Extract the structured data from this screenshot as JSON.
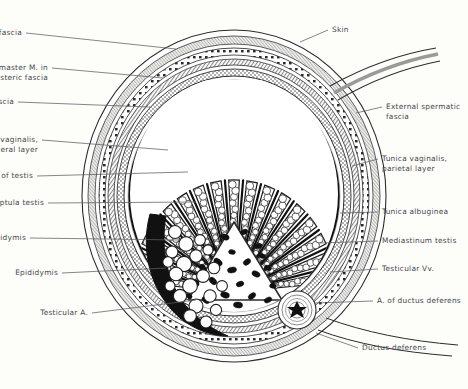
{
  "figure": {
    "type": "anatomical-illustration",
    "background_color": "#fdfdf9",
    "ink_color": "#2b2b2b",
    "label_color": "#44484f"
  },
  "labels_left": [
    {
      "id": "dartos",
      "text": "Dartos M. in superficial fascia",
      "x": 22,
      "y": 33,
      "lead_to_x": 176,
      "lead_to_y": 49
    },
    {
      "id": "cremaster",
      "text": "Cremaster M. in\ncremasteric fascia",
      "x": 48,
      "y": 68,
      "lead_to_x": 163,
      "lead_to_y": 78
    },
    {
      "id": "internal-spermatic",
      "text": "Internal spermatic fascia",
      "x": 14,
      "y": 102,
      "lead_to_x": 150,
      "lead_to_y": 107
    },
    {
      "id": "tunica-visceral",
      "text": "Tunica vaginalis,\nvisceral layer",
      "x": 38,
      "y": 140,
      "lead_to_x": 168,
      "lead_to_y": 150
    },
    {
      "id": "lobules",
      "text": "Lobules of testis",
      "x": 33,
      "y": 176,
      "lead_to_x": 188,
      "lead_to_y": 172
    },
    {
      "id": "septula",
      "text": "Septula testis",
      "x": 44,
      "y": 203,
      "lead_to_x": 196,
      "lead_to_y": 202
    },
    {
      "id": "sinus-epididymis",
      "text": "Sinus of epididymis",
      "x": 26,
      "y": 238,
      "lead_to_x": 181,
      "lead_to_y": 240
    },
    {
      "id": "epididymis",
      "text": "Epididymis",
      "x": 58,
      "y": 273,
      "lead_to_x": 166,
      "lead_to_y": 268
    },
    {
      "id": "testicular-a",
      "text": "Testicular A.",
      "x": 88,
      "y": 313,
      "lead_to_x": 196,
      "lead_to_y": 300
    }
  ],
  "labels_right": [
    {
      "id": "skin",
      "text": "Skin",
      "x": 332,
      "y": 30,
      "lead_to_x": 300,
      "lead_to_y": 42
    },
    {
      "id": "external-spermatic",
      "text": "External spermatic\nfascia",
      "x": 386,
      "y": 107,
      "lead_to_x": 356,
      "lead_to_y": 113
    },
    {
      "id": "tunica-parietal",
      "text": "Tunica vaginalis,\nparietal layer",
      "x": 382,
      "y": 159,
      "lead_to_x": 352,
      "lead_to_y": 166
    },
    {
      "id": "tunica-albuginea",
      "text": "Tunica albuginea",
      "x": 382,
      "y": 212,
      "lead_to_x": 340,
      "lead_to_y": 213
    },
    {
      "id": "mediastinum",
      "text": "Mediastinum testis",
      "x": 382,
      "y": 241,
      "lead_to_x": 320,
      "lead_to_y": 243
    },
    {
      "id": "testicular-vv",
      "text": "Testicular Vv.",
      "x": 382,
      "y": 269,
      "lead_to_x": 330,
      "lead_to_y": 272
    },
    {
      "id": "a-ductus-deferens",
      "text": "A. of ductus deferens",
      "x": 377,
      "y": 301,
      "lead_to_x": 315,
      "lead_to_y": 303
    },
    {
      "id": "ductus-deferens",
      "text": "Ductus deferens",
      "x": 362,
      "y": 348,
      "lead_to_x": 316,
      "lead_to_y": 333
    }
  ]
}
